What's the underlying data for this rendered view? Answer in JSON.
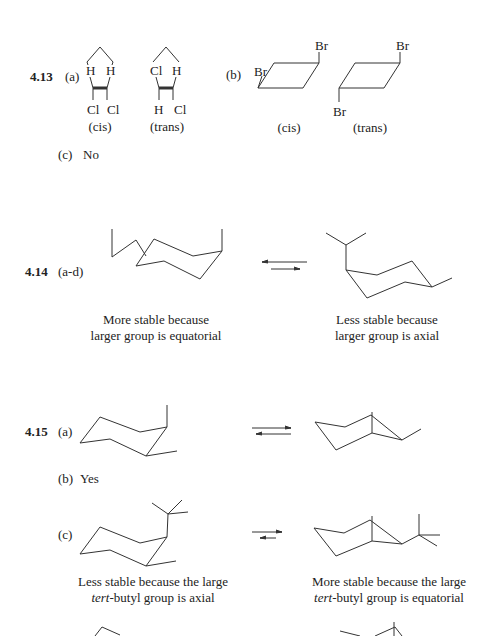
{
  "problems": [
    {
      "number": "4.13",
      "parts": [
        {
          "label": "(a)",
          "structures": [
            {
              "name": "cis",
              "caption": "(cis)",
              "top_left": "H",
              "top_right": "H",
              "bottom_left": "Cl",
              "bottom_right": "Cl"
            },
            {
              "name": "trans",
              "caption": "(trans)",
              "top_left": "Cl",
              "top_right": "H",
              "bottom_left": "H",
              "bottom_right": "Cl"
            }
          ]
        },
        {
          "label": "(b)",
          "structures": [
            {
              "name": "cis",
              "caption": "(cis)",
              "substituent_1": "Br",
              "substituent_2": "Br"
            },
            {
              "name": "trans",
              "caption": "(trans)",
              "substituent_1": "Br",
              "substituent_2": "Br"
            }
          ]
        },
        {
          "label": "(c)",
          "answer": "No"
        }
      ]
    },
    {
      "number": "4.14",
      "parts": [
        {
          "label": "(a-d)",
          "left_caption": [
            "More stable because",
            "larger group is equatorial"
          ],
          "right_caption": [
            "Less stable because",
            "larger group is axial"
          ]
        }
      ]
    },
    {
      "number": "4.15",
      "parts": [
        {
          "label": "(a)"
        },
        {
          "label": "(b)",
          "answer": "Yes"
        },
        {
          "label": "(c)",
          "left_caption": [
            "Less stable because the large",
            "tert",
            "-butyl group is axial"
          ],
          "right_caption": [
            "More stable because the large",
            "tert",
            "-butyl group is equatorial"
          ]
        }
      ]
    }
  ]
}
